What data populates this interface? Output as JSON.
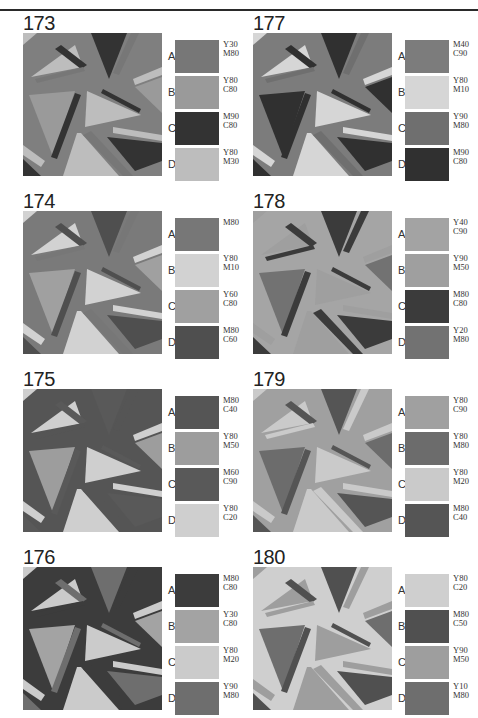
{
  "panels": [
    {
      "number": "173",
      "col": 0,
      "row": 0,
      "bg": "#7f7f7f",
      "swatches": [
        {
          "letter": "A",
          "code1": "Y30",
          "code2": "M80",
          "color": "#777777"
        },
        {
          "letter": "B",
          "code1": "Y80",
          "code2": "C80",
          "color": "#9a9a9a"
        },
        {
          "letter": "C",
          "code1": "M90",
          "code2": "C80",
          "color": "#333333"
        },
        {
          "letter": "D",
          "code1": "Y80",
          "code2": "M30",
          "color": "#bdbdbd"
        }
      ],
      "shapes": [
        "#9a9a9a",
        "#bdbdbd",
        "#333333",
        "#777777"
      ]
    },
    {
      "number": "174",
      "col": 0,
      "row": 1,
      "bg": "#7a7a7a",
      "swatches": [
        {
          "letter": "A",
          "code1": "M80",
          "code2": "",
          "color": "#777777"
        },
        {
          "letter": "B",
          "code1": "Y80",
          "code2": "M10",
          "color": "#d2d2d2"
        },
        {
          "letter": "C",
          "code1": "Y60",
          "code2": "C80",
          "color": "#a0a0a0"
        },
        {
          "letter": "D",
          "code1": "M80",
          "code2": "C60",
          "color": "#4f4f4f"
        }
      ],
      "shapes": [
        "#a0a0a0",
        "#d2d2d2",
        "#4f4f4f",
        "#777777"
      ]
    },
    {
      "number": "175",
      "col": 0,
      "row": 2,
      "bg": "#555555",
      "swatches": [
        {
          "letter": "A",
          "code1": "M80",
          "code2": "C40",
          "color": "#555555"
        },
        {
          "letter": "B",
          "code1": "Y80",
          "code2": "M50",
          "color": "#9d9d9d"
        },
        {
          "letter": "C",
          "code1": "M60",
          "code2": "C90",
          "color": "#595959"
        },
        {
          "letter": "D",
          "code1": "Y80",
          "code2": "C20",
          "color": "#cfcfcf"
        }
      ],
      "shapes": [
        "#9d9d9d",
        "#cfcfcf",
        "#595959",
        "#555555"
      ]
    },
    {
      "number": "176",
      "col": 0,
      "row": 3,
      "bg": "#3c3c3c",
      "swatches": [
        {
          "letter": "A",
          "code1": "M80",
          "code2": "C80",
          "color": "#3c3c3c"
        },
        {
          "letter": "B",
          "code1": "Y30",
          "code2": "C80",
          "color": "#a3a3a3"
        },
        {
          "letter": "C",
          "code1": "Y80",
          "code2": "M20",
          "color": "#cbcbcb"
        },
        {
          "letter": "D",
          "code1": "Y90",
          "code2": "M80",
          "color": "#6e6e6e"
        }
      ],
      "shapes": [
        "#a3a3a3",
        "#cbcbcb",
        "#6e6e6e",
        "#3c3c3c"
      ]
    },
    {
      "number": "177",
      "col": 1,
      "row": 0,
      "bg": "#7c7c7c",
      "swatches": [
        {
          "letter": "A",
          "code1": "M40",
          "code2": "C90",
          "color": "#7c7c7c"
        },
        {
          "letter": "B",
          "code1": "Y80",
          "code2": "M10",
          "color": "#d6d6d6"
        },
        {
          "letter": "C",
          "code1": "Y90",
          "code2": "M80",
          "color": "#6f6f6f"
        },
        {
          "letter": "D",
          "code1": "M90",
          "code2": "C80",
          "color": "#303030"
        }
      ],
      "shapes": [
        "#303030",
        "#d6d6d6",
        "#303030",
        "#6f6f6f"
      ]
    },
    {
      "number": "178",
      "col": 1,
      "row": 1,
      "bg": "#a5a5a5",
      "swatches": [
        {
          "letter": "A",
          "code1": "Y40",
          "code2": "C90",
          "color": "#a3a3a3"
        },
        {
          "letter": "B",
          "code1": "Y90",
          "code2": "M50",
          "color": "#9f9f9f"
        },
        {
          "letter": "C",
          "code1": "M80",
          "code2": "C80",
          "color": "#3b3b3b"
        },
        {
          "letter": "D",
          "code1": "Y20",
          "code2": "M80",
          "color": "#727272"
        }
      ],
      "shapes": [
        "#727272",
        "#9f9f9f",
        "#3b3b3b",
        "#3b3b3b"
      ]
    },
    {
      "number": "179",
      "col": 1,
      "row": 2,
      "bg": "#a0a0a0",
      "swatches": [
        {
          "letter": "A",
          "code1": "Y80",
          "code2": "C90",
          "color": "#a0a0a0"
        },
        {
          "letter": "B",
          "code1": "Y80",
          "code2": "M80",
          "color": "#6c6c6c"
        },
        {
          "letter": "C",
          "code1": "Y80",
          "code2": "M20",
          "color": "#cacaca"
        },
        {
          "letter": "D",
          "code1": "M80",
          "code2": "C40",
          "color": "#555555"
        }
      ],
      "shapes": [
        "#6c6c6c",
        "#cacaca",
        "#555555",
        "#cacaca"
      ]
    },
    {
      "number": "180",
      "col": 1,
      "row": 3,
      "bg": "#cfcfcf",
      "swatches": [
        {
          "letter": "A",
          "code1": "Y80",
          "code2": "C20",
          "color": "#cfcfcf"
        },
        {
          "letter": "B",
          "code1": "M80",
          "code2": "C50",
          "color": "#505050"
        },
        {
          "letter": "C",
          "code1": "Y90",
          "code2": "M50",
          "color": "#9e9e9e"
        },
        {
          "letter": "D",
          "code1": "Y10",
          "code2": "M80",
          "color": "#6e6e6e"
        }
      ],
      "shapes": [
        "#6e6e6e",
        "#9e9e9e",
        "#505050",
        "#9e9e9e"
      ]
    }
  ]
}
